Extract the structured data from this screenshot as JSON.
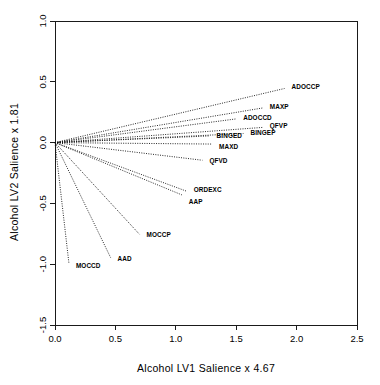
{
  "chart_data": {
    "type": "scatter",
    "title": "",
    "subtitle": "",
    "xlabel": "Alcohol  LV1 Salience  x  4.67",
    "ylabel": "Alcohol LV2 Salience  x  1.81",
    "xlim": [
      0.0,
      2.5
    ],
    "ylim": [
      -1.5,
      1.0
    ],
    "xticks": [
      "0.0",
      "0.5",
      "1.0",
      "1.5",
      "2.0",
      "2.5"
    ],
    "xtick_values": [
      0.0,
      0.5,
      1.0,
      1.5,
      2.0,
      2.5
    ],
    "yticks": [
      "1.0",
      "0.5",
      "0.0",
      "-0.5",
      "-1.0",
      "-1.5"
    ],
    "ytick_values": [
      1.0,
      0.5,
      0.0,
      -0.5,
      -1.0,
      -1.5
    ],
    "grid": false,
    "legend": false,
    "origin": [
      0.0,
      0.0
    ],
    "line_style": "dotted",
    "points": [
      {
        "label": "ADOCCP",
        "x": 1.9,
        "y": 0.445,
        "label_dx": 7,
        "label_dy": 1
      },
      {
        "label": "MAXP",
        "x": 1.72,
        "y": 0.285,
        "label_dx": 7,
        "label_dy": 1
      },
      {
        "label": "ADOCCD",
        "x": 1.5,
        "y": 0.195,
        "label_dx": 7,
        "label_dy": 1
      },
      {
        "label": "QFVP",
        "x": 1.72,
        "y": 0.125,
        "label_dx": 7,
        "label_dy": 1
      },
      {
        "label": "BINGEP",
        "x": 1.56,
        "y": 0.075,
        "label_dx": 7,
        "label_dy": 2
      },
      {
        "label": "BINGED",
        "x": 1.28,
        "y": 0.055,
        "label_dx": 7,
        "label_dy": 2
      },
      {
        "label": "MAXD",
        "x": 1.3,
        "y": -0.012,
        "label_dx": 7,
        "label_dy": 5
      },
      {
        "label": "QFVD",
        "x": 1.22,
        "y": -0.145,
        "label_dx": 7,
        "label_dy": 3
      },
      {
        "label": "ORDEXC",
        "x": 1.09,
        "y": -0.4,
        "label_dx": 7,
        "label_dy": 1
      },
      {
        "label": "AAP",
        "x": 1.05,
        "y": -0.43,
        "label_dx": 7,
        "label_dy": 9
      },
      {
        "label": "MOCCP",
        "x": 0.7,
        "y": -0.755,
        "label_dx": 7,
        "label_dy": 3
      },
      {
        "label": "AAD",
        "x": 0.46,
        "y": -0.945,
        "label_dx": 7,
        "label_dy": 3
      },
      {
        "label": "MOCCD",
        "x": 0.115,
        "y": -0.99,
        "label_dx": 7,
        "label_dy": 5
      }
    ]
  }
}
